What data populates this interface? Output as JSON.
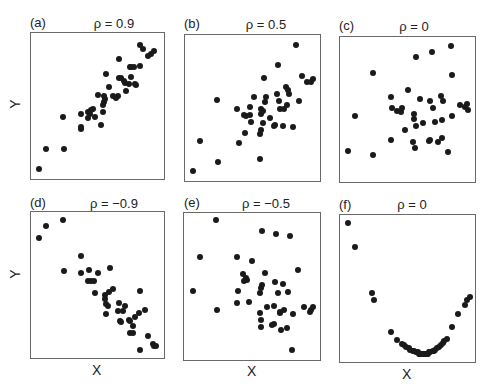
{
  "chart_data": [
    {
      "type": "scatter",
      "panel": "(a)",
      "title": "ρ = 0.9",
      "xlabel": "",
      "ylabel": "Y",
      "grid": false,
      "xlim": [
        0,
        100
      ],
      "ylim": [
        0,
        100
      ],
      "points": [
        [
          3,
          4
        ],
        [
          9,
          19
        ],
        [
          22,
          42
        ],
        [
          23,
          19
        ],
        [
          37,
          44
        ],
        [
          37,
          33
        ],
        [
          37,
          35
        ],
        [
          42,
          46
        ],
        [
          42,
          41
        ],
        [
          44,
          44
        ],
        [
          45,
          47
        ],
        [
          46,
          48
        ],
        [
          48,
          42
        ],
        [
          50,
          58
        ],
        [
          53,
          36
        ],
        [
          54,
          46
        ],
        [
          54,
          51
        ],
        [
          55,
          57
        ],
        [
          56,
          55
        ],
        [
          55,
          53
        ],
        [
          57,
          73
        ],
        [
          59,
          64
        ],
        [
          62,
          57
        ],
        [
          65,
          56
        ],
        [
          66,
          57
        ],
        [
          67,
          70
        ],
        [
          67,
          84
        ],
        [
          69,
          70
        ],
        [
          71,
          68
        ],
        [
          72,
          67
        ],
        [
          73,
          61
        ],
        [
          75,
          66
        ],
        [
          76,
          78
        ],
        [
          77,
          78
        ],
        [
          77,
          71
        ],
        [
          79,
          78
        ],
        [
          80,
          66
        ],
        [
          81,
          65
        ],
        [
          84,
          79
        ],
        [
          84,
          94
        ],
        [
          86,
          91
        ],
        [
          90,
          86
        ],
        [
          93,
          88
        ],
        [
          95,
          90
        ]
      ]
    },
    {
      "type": "scatter",
      "panel": "(b)",
      "title": "ρ = 0.5",
      "xlabel": "",
      "ylabel": "",
      "grid": false,
      "xlim": [
        0,
        100
      ],
      "ylim": [
        0,
        100
      ],
      "points": [
        [
          3,
          4
        ],
        [
          9,
          26
        ],
        [
          23,
          11
        ],
        [
          22,
          56
        ],
        [
          38,
          49
        ],
        [
          39,
          25
        ],
        [
          43,
          45
        ],
        [
          44,
          32
        ],
        [
          45,
          44
        ],
        [
          48,
          45
        ],
        [
          48,
          51
        ],
        [
          49,
          40
        ],
        [
          51,
          58
        ],
        [
          56,
          13
        ],
        [
          56,
          31
        ],
        [
          57,
          34
        ],
        [
          57,
          49
        ],
        [
          57,
          46
        ],
        [
          58,
          48
        ],
        [
          58,
          39
        ],
        [
          59,
          72
        ],
        [
          60,
          54
        ],
        [
          61,
          58
        ],
        [
          64,
          43
        ],
        [
          67,
          37
        ],
        [
          68,
          38
        ],
        [
          69,
          60
        ],
        [
          70,
          81
        ],
        [
          71,
          55
        ],
        [
          72,
          49
        ],
        [
          74,
          37
        ],
        [
          75,
          49
        ],
        [
          76,
          65
        ],
        [
          77,
          52
        ],
        [
          78,
          63
        ],
        [
          79,
          60
        ],
        [
          82,
          36
        ],
        [
          84,
          96
        ],
        [
          87,
          55
        ],
        [
          89,
          73
        ],
        [
          93,
          69
        ],
        [
          96,
          69
        ],
        [
          98,
          71
        ]
      ]
    },
    {
      "type": "scatter",
      "panel": "(c)",
      "title": "ρ = 0",
      "xlabel": "",
      "ylabel": "",
      "grid": false,
      "xlim": [
        0,
        100
      ],
      "ylim": [
        0,
        100
      ],
      "points": [
        [
          3,
          20
        ],
        [
          9,
          45
        ],
        [
          23,
          17
        ],
        [
          23,
          77
        ],
        [
          37,
          28
        ],
        [
          37,
          59
        ],
        [
          38,
          51
        ],
        [
          42,
          49
        ],
        [
          45,
          48
        ],
        [
          46,
          51
        ],
        [
          48,
          35
        ],
        [
          50,
          64
        ],
        [
          54,
          26
        ],
        [
          55,
          47
        ],
        [
          55,
          43
        ],
        [
          56,
          22
        ],
        [
          57,
          38
        ],
        [
          57,
          88
        ],
        [
          60,
          58
        ],
        [
          62,
          40
        ],
        [
          67,
          27
        ],
        [
          68,
          28
        ],
        [
          68,
          56
        ],
        [
          69,
          92
        ],
        [
          70,
          51
        ],
        [
          72,
          41
        ],
        [
          74,
          26
        ],
        [
          76,
          60
        ],
        [
          77,
          29
        ],
        [
          77,
          42
        ],
        [
          78,
          56
        ],
        [
          82,
          19
        ],
        [
          84,
          96
        ],
        [
          85,
          75
        ],
        [
          85,
          45
        ],
        [
          91,
          53
        ],
        [
          95,
          52
        ],
        [
          97,
          54
        ],
        [
          98,
          50
        ]
      ]
    },
    {
      "type": "scatter",
      "panel": "(d)",
      "title": "ρ = −0.9",
      "xlabel": "X",
      "ylabel": "Y",
      "grid": false,
      "xlim": [
        0,
        100
      ],
      "ylim": [
        0,
        100
      ],
      "points": [
        [
          3,
          84
        ],
        [
          9,
          93
        ],
        [
          22,
          97
        ],
        [
          23,
          60
        ],
        [
          37,
          59
        ],
        [
          37,
          71
        ],
        [
          42,
          53
        ],
        [
          43,
          61
        ],
        [
          45,
          53
        ],
        [
          47,
          53
        ],
        [
          48,
          44
        ],
        [
          50,
          59
        ],
        [
          56,
          43
        ],
        [
          56,
          40
        ],
        [
          57,
          36
        ],
        [
          57,
          29
        ],
        [
          58,
          35
        ],
        [
          60,
          62
        ],
        [
          59,
          45
        ],
        [
          62,
          47
        ],
        [
          66,
          31
        ],
        [
          67,
          37
        ],
        [
          68,
          24
        ],
        [
          69,
          23
        ],
        [
          70,
          31
        ],
        [
          72,
          35
        ],
        [
          75,
          25
        ],
        [
          76,
          24
        ],
        [
          76,
          15
        ],
        [
          78,
          15
        ],
        [
          78,
          20
        ],
        [
          80,
          27
        ],
        [
          83,
          30
        ],
        [
          84,
          46
        ],
        [
          84,
          3
        ],
        [
          88,
          32
        ],
        [
          90,
          13
        ],
        [
          94,
          7
        ],
        [
          95,
          6
        ],
        [
          97,
          6
        ]
      ]
    },
    {
      "type": "scatter",
      "panel": "(e)",
      "title": "ρ = −0.5",
      "xlabel": "X",
      "ylabel": "",
      "grid": false,
      "xlim": [
        0,
        100
      ],
      "ylim": [
        0,
        100
      ],
      "points": [
        [
          4,
          47
        ],
        [
          9,
          71
        ],
        [
          22,
          98
        ],
        [
          23,
          33
        ],
        [
          38,
          71
        ],
        [
          38,
          38
        ],
        [
          39,
          47
        ],
        [
          43,
          59
        ],
        [
          44,
          54
        ],
        [
          45,
          56
        ],
        [
          46,
          55
        ],
        [
          48,
          39
        ],
        [
          50,
          68
        ],
        [
          56,
          31
        ],
        [
          56,
          45
        ],
        [
          57,
          49
        ],
        [
          57,
          21
        ],
        [
          57,
          26
        ],
        [
          58,
          51
        ],
        [
          58,
          90
        ],
        [
          60,
          60
        ],
        [
          62,
          35
        ],
        [
          67,
          36
        ],
        [
          66,
          22
        ],
        [
          67,
          23
        ],
        [
          68,
          53
        ],
        [
          69,
          88
        ],
        [
          70,
          45
        ],
        [
          72,
          31
        ],
        [
          72,
          32
        ],
        [
          73,
          19
        ],
        [
          74,
          52
        ],
        [
          75,
          33
        ],
        [
          77,
          20
        ],
        [
          78,
          46
        ],
        [
          80,
          86
        ],
        [
          81,
          4
        ],
        [
          82,
          30
        ],
        [
          86,
          62
        ],
        [
          91,
          35
        ],
        [
          95,
          32
        ],
        [
          96,
          33
        ],
        [
          98,
          35
        ]
      ]
    },
    {
      "type": "scatter",
      "panel": "(f)",
      "title": "ρ = 0",
      "xlabel": "X",
      "ylabel": "",
      "grid": false,
      "xlim": [
        0,
        100
      ],
      "ylim": [
        0,
        100
      ],
      "points": [
        [
          3,
          97
        ],
        [
          9,
          80
        ],
        [
          22,
          47
        ],
        [
          24,
          42
        ],
        [
          37,
          19
        ],
        [
          42,
          13
        ],
        [
          46,
          10
        ],
        [
          47,
          9
        ],
        [
          49,
          8
        ],
        [
          51,
          7
        ],
        [
          52,
          6
        ],
        [
          54,
          5
        ],
        [
          55,
          5
        ],
        [
          57,
          4
        ],
        [
          58,
          4
        ],
        [
          59,
          3
        ],
        [
          60,
          3
        ],
        [
          61,
          3
        ],
        [
          62,
          3
        ],
        [
          63,
          3
        ],
        [
          64,
          3
        ],
        [
          65,
          3
        ],
        [
          66,
          3
        ],
        [
          67,
          4
        ],
        [
          68,
          4
        ],
        [
          70,
          5
        ],
        [
          71,
          5
        ],
        [
          72,
          6
        ],
        [
          73,
          7
        ],
        [
          75,
          8
        ],
        [
          76,
          9
        ],
        [
          78,
          11
        ],
        [
          79,
          12
        ],
        [
          81,
          14
        ],
        [
          85,
          22
        ],
        [
          90,
          32
        ],
        [
          95,
          38
        ],
        [
          97,
          42
        ],
        [
          99,
          44
        ]
      ]
    }
  ],
  "panels": [
    {
      "label": "(a)",
      "title": "ρ = 0.9",
      "xlabel": "",
      "ylabel": "Y"
    },
    {
      "label": "(b)",
      "title": "ρ = 0.5",
      "xlabel": "",
      "ylabel": ""
    },
    {
      "label": "(c)",
      "title": "ρ = 0",
      "xlabel": "",
      "ylabel": ""
    },
    {
      "label": "(d)",
      "title": "ρ = −0.9",
      "xlabel": "X",
      "ylabel": "Y"
    },
    {
      "label": "(e)",
      "title": "ρ = −0.5",
      "xlabel": "X",
      "ylabel": ""
    },
    {
      "label": "(f)",
      "title": "ρ = 0",
      "xlabel": "X",
      "ylabel": ""
    }
  ]
}
